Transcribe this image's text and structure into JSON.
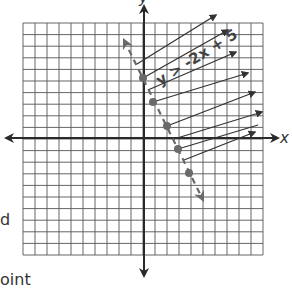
{
  "graph": {
    "inequality_label": "y > -2x + 5",
    "x_axis_label": "x",
    "y_axis_label": "y",
    "grid": {
      "cells_x": 20,
      "cells_y": 20
    },
    "colors": {
      "grid": "#555555",
      "axis": "#2a2a2a",
      "rays": "#333333",
      "boundary": "#6a6a6a",
      "points": "#6a6a6a"
    },
    "boundary_line": {
      "style": "dashed",
      "equation": "y = -2x + 5"
    },
    "plotted_points": 5
  },
  "margin_text": {
    "left_fragment_1": "d",
    "bottom_fragment": "oint"
  },
  "chart_data": {
    "type": "scatter",
    "title": "y > -2x + 5",
    "xlabel": "x",
    "ylabel": "y",
    "grid": true,
    "xlim": [
      -10,
      10
    ],
    "ylim": [
      -10,
      10
    ],
    "series": [
      {
        "name": "boundary points",
        "x": [
          0,
          1,
          2,
          3,
          4
        ],
        "y": [
          5,
          3,
          1,
          -1,
          -3
        ]
      }
    ],
    "annotations": [
      "dashed boundary line y = -2x + 5",
      "shading arrows pointing up-right (region above line)"
    ]
  }
}
